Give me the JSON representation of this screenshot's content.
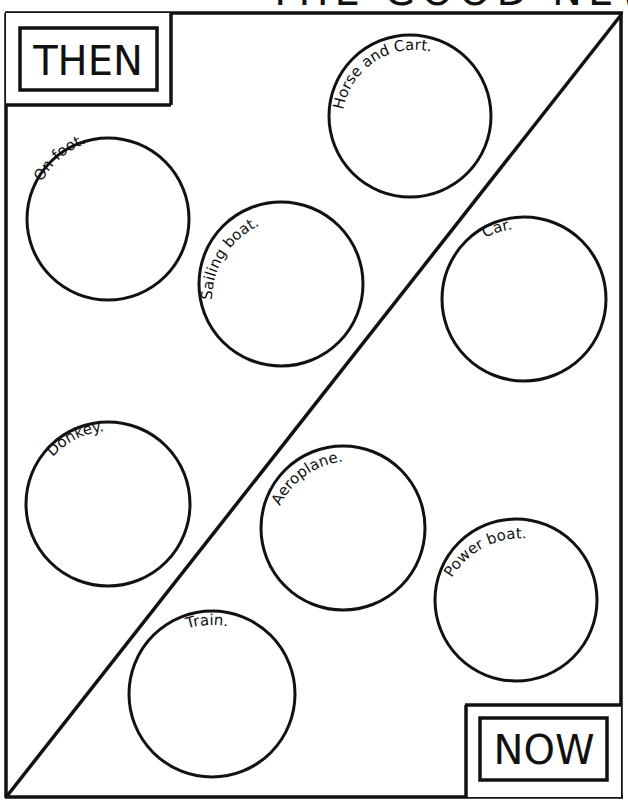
{
  "header": {
    "cropped_title": "THE GOOD NEWS"
  },
  "corners": {
    "then_label": "THEN",
    "now_label": "NOW"
  },
  "circles": [
    {
      "label": "Horse and Cart.",
      "side": "then"
    },
    {
      "label": "On foot.",
      "side": "then"
    },
    {
      "label": "Sailing boat.",
      "side": "then"
    },
    {
      "label": "Car.",
      "side": "now"
    },
    {
      "label": "Donkey.",
      "side": "then"
    },
    {
      "label": "Aeroplane.",
      "side": "now"
    },
    {
      "label": "Power boat.",
      "side": "now"
    },
    {
      "label": "Train.",
      "side": "now"
    }
  ],
  "colors": {
    "ink": "#111111",
    "paper": "#ffffff"
  }
}
